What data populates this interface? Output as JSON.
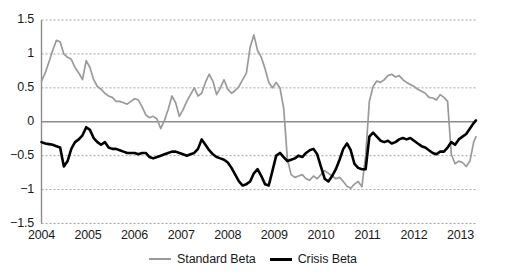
{
  "chart_data": {
    "type": "line",
    "title": "",
    "subtitle": "",
    "xlabel": "",
    "ylabel": "",
    "xlim": [
      2004.0,
      2013.33
    ],
    "ylim": [
      -1.5,
      1.5
    ],
    "grid": true,
    "gridlines_y": [
      1.5,
      1.0,
      0.5,
      -0.5,
      -1.0,
      -1.5
    ],
    "zero_line": 0,
    "legend_position": "bottom-center",
    "y_ticks": [
      "1.5",
      "1",
      "0.5",
      "0",
      "-0.5",
      "-1",
      "-1.5"
    ],
    "y_tick_values": [
      1.5,
      1.0,
      0.5,
      0.0,
      -0.5,
      -1.0,
      -1.5
    ],
    "x_ticks": [
      "2004",
      "2005",
      "2006",
      "2007",
      "2008",
      "2009",
      "2010",
      "2011",
      "2012",
      "2013"
    ],
    "x_tick_values": [
      2004,
      2005,
      2006,
      2007,
      2008,
      2009,
      2010,
      2011,
      2012,
      2013
    ],
    "series": [
      {
        "name": "Standard Beta",
        "color": "#9a9a9a",
        "width": 1.7,
        "x": [
          2004.0,
          2004.08,
          2004.16,
          2004.24,
          2004.32,
          2004.4,
          2004.48,
          2004.56,
          2004.64,
          2004.72,
          2004.8,
          2004.88,
          2004.96,
          2005.04,
          2005.12,
          2005.2,
          2005.28,
          2005.36,
          2005.44,
          2005.52,
          2005.6,
          2005.68,
          2005.76,
          2005.84,
          2005.92,
          2006.0,
          2006.08,
          2006.16,
          2006.24,
          2006.32,
          2006.4,
          2006.48,
          2006.56,
          2006.64,
          2006.72,
          2006.8,
          2006.88,
          2006.96,
          2007.04,
          2007.12,
          2007.2,
          2007.28,
          2007.36,
          2007.44,
          2007.52,
          2007.6,
          2007.68,
          2007.76,
          2007.84,
          2007.92,
          2008.0,
          2008.08,
          2008.16,
          2008.24,
          2008.32,
          2008.4,
          2008.48,
          2008.56,
          2008.64,
          2008.72,
          2008.8,
          2008.88,
          2008.96,
          2009.04,
          2009.12,
          2009.2,
          2009.28,
          2009.36,
          2009.44,
          2009.52,
          2009.6,
          2009.68,
          2009.76,
          2009.84,
          2009.92,
          2010.0,
          2010.08,
          2010.16,
          2010.24,
          2010.32,
          2010.4,
          2010.48,
          2010.56,
          2010.64,
          2010.72,
          2010.8,
          2010.88,
          2010.96,
          2011.04,
          2011.12,
          2011.2,
          2011.28,
          2011.36,
          2011.44,
          2011.52,
          2011.6,
          2011.68,
          2011.76,
          2011.84,
          2011.92,
          2012.0,
          2012.08,
          2012.16,
          2012.24,
          2012.32,
          2012.4,
          2012.48,
          2012.56,
          2012.64,
          2012.72,
          2012.8,
          2012.88,
          2012.96,
          2013.04,
          2013.12,
          2013.2,
          2013.28,
          2013.33
        ],
        "values": [
          0.6,
          0.72,
          0.88,
          1.05,
          1.2,
          1.18,
          1.0,
          0.95,
          0.92,
          0.8,
          0.72,
          0.62,
          0.9,
          0.8,
          0.62,
          0.52,
          0.48,
          0.42,
          0.38,
          0.36,
          0.3,
          0.3,
          0.28,
          0.26,
          0.3,
          0.34,
          0.32,
          0.22,
          0.1,
          0.06,
          0.08,
          0.04,
          -0.1,
          0.02,
          0.18,
          0.38,
          0.28,
          0.08,
          0.18,
          0.3,
          0.4,
          0.5,
          0.38,
          0.42,
          0.58,
          0.7,
          0.6,
          0.4,
          0.5,
          0.62,
          0.48,
          0.42,
          0.46,
          0.52,
          0.62,
          0.72,
          1.1,
          1.28,
          1.05,
          0.95,
          0.78,
          0.58,
          0.5,
          0.58,
          0.5,
          0.2,
          -0.55,
          -0.78,
          -0.82,
          -0.8,
          -0.78,
          -0.84,
          -0.86,
          -0.8,
          -0.84,
          -0.78,
          -0.72,
          -0.76,
          -0.8,
          -0.84,
          -0.82,
          -0.88,
          -0.95,
          -0.98,
          -0.92,
          -0.88,
          -0.96,
          -0.5,
          0.3,
          0.52,
          0.6,
          0.58,
          0.62,
          0.68,
          0.7,
          0.66,
          0.68,
          0.62,
          0.58,
          0.55,
          0.52,
          0.48,
          0.45,
          0.42,
          0.36,
          0.35,
          0.32,
          0.4,
          0.36,
          0.3,
          -0.48,
          -0.62,
          -0.58,
          -0.6,
          -0.66,
          -0.58,
          -0.3,
          -0.22
        ]
      },
      {
        "name": "Crisis Beta",
        "color": "#000000",
        "width": 2.6,
        "x": [
          2004.0,
          2004.08,
          2004.16,
          2004.24,
          2004.32,
          2004.4,
          2004.48,
          2004.56,
          2004.64,
          2004.72,
          2004.8,
          2004.88,
          2004.96,
          2005.04,
          2005.12,
          2005.2,
          2005.28,
          2005.36,
          2005.44,
          2005.52,
          2005.6,
          2005.68,
          2005.76,
          2005.84,
          2005.92,
          2006.0,
          2006.08,
          2006.16,
          2006.24,
          2006.32,
          2006.4,
          2006.48,
          2006.56,
          2006.64,
          2006.72,
          2006.8,
          2006.88,
          2006.96,
          2007.04,
          2007.12,
          2007.2,
          2007.28,
          2007.36,
          2007.44,
          2007.52,
          2007.6,
          2007.68,
          2007.76,
          2007.84,
          2007.92,
          2008.0,
          2008.08,
          2008.16,
          2008.24,
          2008.32,
          2008.4,
          2008.48,
          2008.56,
          2008.64,
          2008.72,
          2008.8,
          2008.88,
          2008.96,
          2009.04,
          2009.12,
          2009.2,
          2009.28,
          2009.36,
          2009.44,
          2009.52,
          2009.6,
          2009.68,
          2009.76,
          2009.84,
          2009.92,
          2010.0,
          2010.08,
          2010.16,
          2010.24,
          2010.32,
          2010.4,
          2010.48,
          2010.56,
          2010.64,
          2010.72,
          2010.8,
          2010.88,
          2010.96,
          2011.04,
          2011.12,
          2011.2,
          2011.28,
          2011.36,
          2011.44,
          2011.52,
          2011.6,
          2011.68,
          2011.76,
          2011.84,
          2011.92,
          2012.0,
          2012.08,
          2012.16,
          2012.24,
          2012.32,
          2012.4,
          2012.48,
          2012.56,
          2012.64,
          2012.72,
          2012.8,
          2012.88,
          2012.96,
          2013.04,
          2013.12,
          2013.2,
          2013.28,
          2013.33
        ],
        "values": [
          -0.3,
          -0.32,
          -0.33,
          -0.34,
          -0.36,
          -0.38,
          -0.66,
          -0.58,
          -0.4,
          -0.3,
          -0.26,
          -0.2,
          -0.08,
          -0.12,
          -0.24,
          -0.3,
          -0.34,
          -0.3,
          -0.38,
          -0.4,
          -0.4,
          -0.42,
          -0.44,
          -0.46,
          -0.46,
          -0.46,
          -0.48,
          -0.46,
          -0.46,
          -0.52,
          -0.54,
          -0.52,
          -0.5,
          -0.48,
          -0.46,
          -0.44,
          -0.44,
          -0.46,
          -0.48,
          -0.5,
          -0.48,
          -0.46,
          -0.4,
          -0.26,
          -0.34,
          -0.42,
          -0.48,
          -0.52,
          -0.54,
          -0.56,
          -0.6,
          -0.68,
          -0.78,
          -0.88,
          -0.94,
          -0.92,
          -0.88,
          -0.76,
          -0.7,
          -0.8,
          -0.92,
          -0.94,
          -0.72,
          -0.5,
          -0.46,
          -0.52,
          -0.58,
          -0.56,
          -0.54,
          -0.5,
          -0.52,
          -0.46,
          -0.42,
          -0.4,
          -0.48,
          -0.66,
          -0.84,
          -0.88,
          -0.8,
          -0.7,
          -0.56,
          -0.4,
          -0.32,
          -0.42,
          -0.62,
          -0.68,
          -0.7,
          -0.7,
          -0.22,
          -0.16,
          -0.22,
          -0.28,
          -0.3,
          -0.28,
          -0.32,
          -0.3,
          -0.26,
          -0.24,
          -0.26,
          -0.24,
          -0.28,
          -0.32,
          -0.36,
          -0.38,
          -0.42,
          -0.46,
          -0.48,
          -0.44,
          -0.44,
          -0.38,
          -0.3,
          -0.34,
          -0.26,
          -0.22,
          -0.18,
          -0.1,
          -0.02,
          0.02
        ]
      }
    ]
  },
  "legend": {
    "entries": [
      {
        "label": "Standard Beta",
        "color": "#9a9a9a",
        "style": "standard"
      },
      {
        "label": "Crisis Beta",
        "color": "#000000",
        "style": "crisis"
      }
    ]
  },
  "axes": {
    "y_labels": [
      "1.5",
      "1",
      "0.5",
      "0",
      "-0.5",
      "-1",
      "-1.5"
    ],
    "x_labels": [
      "2004",
      "2005",
      "2006",
      "2007",
      "2008",
      "2009",
      "2010",
      "2011",
      "2012",
      "2013"
    ]
  },
  "colors": {
    "standard_beta": "#9a9a9a",
    "crisis_beta": "#000000",
    "gridline": "#9a9a9a",
    "axis": "#8c8c8c",
    "zero_line": "#8c8c8c",
    "background": "#ffffff",
    "text": "#1a1a1a"
  }
}
